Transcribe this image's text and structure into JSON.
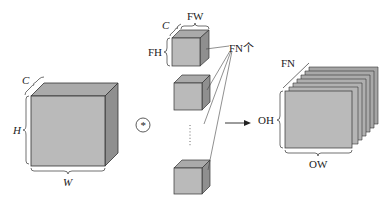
{
  "diagram": {
    "type": "convolution-with-multiple-filters",
    "colors": {
      "front": "#b9b9b9",
      "top": "#a9a9a9",
      "side": "#8e8e8e",
      "stroke": "#333333",
      "background": "#ffffff"
    },
    "input": {
      "channel_label": "C",
      "height_label": "H",
      "width_label": "W"
    },
    "operator": {
      "symbol": "*"
    },
    "filters": {
      "channel_label": "C",
      "width_label": "FW",
      "height_label": "FH",
      "count_label": "FN个",
      "ellipsis": "⋮"
    },
    "output": {
      "depth_label": "FN",
      "height_label": "OH",
      "width_label": "OW",
      "layers": 7
    }
  }
}
